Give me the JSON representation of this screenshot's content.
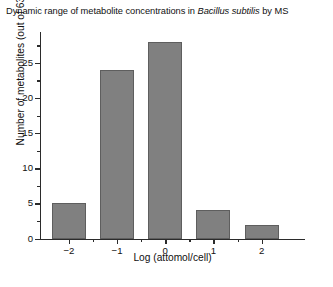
{
  "chart_data": {
    "type": "bar",
    "title": "Dynamic range of metabolite concentrations in Bacillus subtilis by MS",
    "title_parts": {
      "before": "Dynamic range of metabolite concentrations in ",
      "italic": "Bacillus subtilis",
      "after": " by MS"
    },
    "xlabel": "Log (attomol/cell)",
    "ylabel": "Number of metabolites (out of 63 quantified)",
    "categories": [
      "-2",
      "-1",
      "0",
      "1",
      "2"
    ],
    "x": [
      -2,
      -1,
      0,
      1,
      2
    ],
    "values": [
      5,
      24,
      28,
      4,
      2
    ],
    "xlim": [
      -2.6,
      2.9
    ],
    "ylim": [
      0,
      29.4
    ],
    "x_ticks": [
      "−2",
      "−1",
      "0",
      "1",
      "2"
    ],
    "x_tick_values": [
      -2,
      -1,
      0,
      1,
      2
    ],
    "x_minor_tick_values": [
      -1.5,
      -0.5,
      0.5,
      1.5
    ],
    "y_ticks": [
      "0",
      "5",
      "10",
      "15",
      "20",
      "25"
    ],
    "y_tick_values": [
      0,
      5,
      10,
      15,
      20,
      25
    ],
    "y_minor_tick_values": [
      2.5,
      7.5,
      12.5,
      17.5,
      22.5,
      27.5
    ],
    "grid": false,
    "legend": false,
    "bar_color": "#808080",
    "bar_edge_color": "#5e5e5e",
    "axis_color": "#2b2b2b",
    "background_color": "#ffffff",
    "total_quantified": 63
  }
}
